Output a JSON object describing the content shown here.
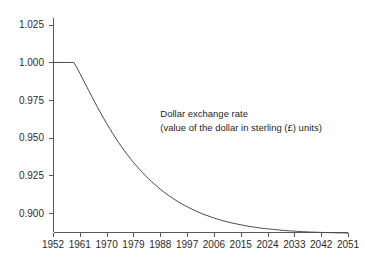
{
  "chart_data": {
    "type": "line",
    "title": "",
    "subtitle": "",
    "xlabel": "",
    "ylabel": "",
    "grid": false,
    "legend": "none",
    "annotations": [
      {
        "name": "series-annotation",
        "line1": "Dollar exchange rate",
        "line2": "(value of the dollar in sterling (£) units)",
        "x_data": 1988,
        "y_data": 0.9635
      }
    ],
    "xlim": [
      1952,
      2051
    ],
    "ylim": [
      0.8875,
      1.0295
    ],
    "x_ticks": [
      1952,
      1961,
      1970,
      1979,
      1988,
      1997,
      2006,
      2015,
      2024,
      2033,
      2042,
      2051
    ],
    "x_tick_labels": [
      "1952",
      "1961",
      "1970",
      "1979",
      "1988",
      "1997",
      "2006",
      "2015",
      "2024",
      "2033",
      "2042",
      "2051"
    ],
    "y_ticks": [
      0.9,
      0.925,
      0.95,
      0.975,
      1.0,
      1.025
    ],
    "y_tick_labels": [
      "0.900",
      "0.925",
      "0.950",
      "0.975",
      "1.000",
      "1.025"
    ],
    "series": [
      {
        "name": "dollar-exchange-rate",
        "x": [
          1952,
          1953,
          1954,
          1955,
          1956,
          1957,
          1958,
          1959,
          1960,
          1961,
          1962,
          1963,
          1964,
          1965,
          1966,
          1967,
          1968,
          1969,
          1970,
          1971,
          1972,
          1973,
          1974,
          1975,
          1976,
          1977,
          1978,
          1979,
          1980,
          1981,
          1982,
          1983,
          1984,
          1985,
          1986,
          1987,
          1988,
          1989,
          1990,
          1991,
          1992,
          1993,
          1994,
          1995,
          1996,
          1997,
          1998,
          1999,
          2000,
          2001,
          2002,
          2003,
          2004,
          2005,
          2006,
          2007,
          2008,
          2009,
          2010,
          2011,
          2012,
          2013,
          2014,
          2015,
          2016,
          2017,
          2018,
          2019,
          2020,
          2021,
          2022,
          2023,
          2024,
          2025,
          2026,
          2027,
          2028,
          2029,
          2030,
          2031,
          2032,
          2033,
          2034,
          2035,
          2036,
          2037,
          2038,
          2039,
          2040,
          2041,
          2042,
          2043,
          2044,
          2045,
          2046,
          2047,
          2048,
          2049,
          2050,
          2051
        ],
        "y": [
          1.0,
          1.0,
          1.0,
          1.0,
          1.0,
          1.0,
          1.0,
          1.0,
          0.9965,
          0.9928,
          0.989,
          0.9852,
          0.9813,
          0.9775,
          0.9737,
          0.97,
          0.9664,
          0.9629,
          0.9595,
          0.9562,
          0.953,
          0.9499,
          0.9469,
          0.9441,
          0.9413,
          0.9387,
          0.9361,
          0.9337,
          0.9314,
          0.9291,
          0.927,
          0.9249,
          0.923,
          0.9211,
          0.9193,
          0.9176,
          0.9159,
          0.9144,
          0.9129,
          0.9115,
          0.9101,
          0.9088,
          0.9076,
          0.9064,
          0.9053,
          0.9043,
          0.9033,
          0.9023,
          0.9014,
          0.9005,
          0.8997,
          0.8989,
          0.8982,
          0.8975,
          0.8968,
          0.8962,
          0.8956,
          0.895,
          0.8945,
          0.894,
          0.8935,
          0.8931,
          0.8927,
          0.8923,
          0.8919,
          0.8915,
          0.8912,
          0.8909,
          0.8906,
          0.8903,
          0.89,
          0.8898,
          0.8896,
          0.8894,
          0.8892,
          0.889,
          0.8888,
          0.8886,
          0.8885,
          0.8883,
          0.8882,
          0.8881,
          0.8879,
          0.8878,
          0.8877,
          0.8876,
          0.8875,
          0.8874,
          0.8874,
          0.8873,
          0.8872,
          0.8872,
          0.8871,
          0.8871,
          0.887,
          0.887,
          0.8869,
          0.8869,
          0.8869,
          0.8868
        ]
      }
    ]
  },
  "plot_geometry": {
    "left": 53,
    "right": 348,
    "top": 18,
    "bottom": 232
  }
}
